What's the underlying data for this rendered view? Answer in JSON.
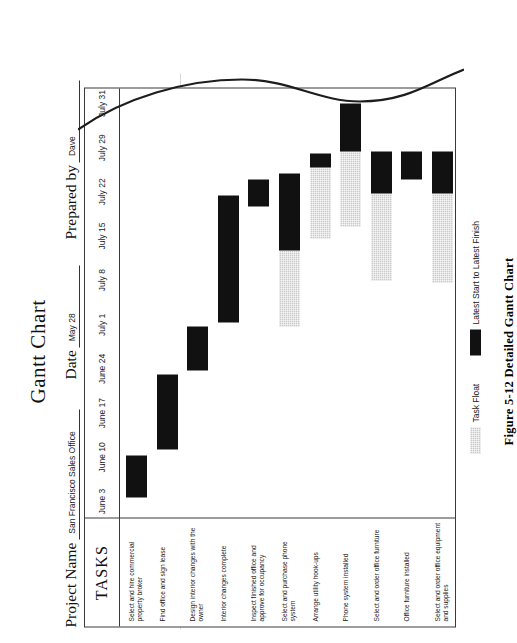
{
  "document": {
    "title": "Gantt Chart",
    "caption": "Figure 5-12  Detailed Gantt Chart"
  },
  "header": {
    "project_name_label": "Project Name",
    "project_name_value": "San Francisco Sales Office",
    "date_label": "Date",
    "date_value": "May 28",
    "prepared_by_label": "Prepared by",
    "prepared_by_value": "Dave"
  },
  "table": {
    "tasks_column_header": "TASKS"
  },
  "legend": {
    "float_label": "Task Float",
    "work_label": "Latest Start to Latest Finish",
    "float_color": "#c9c9c9",
    "work_color": "#111111"
  },
  "chart_data": {
    "type": "bar",
    "orientation": "horizontal",
    "title": "Gantt Chart",
    "subtitle": "San Francisco Sales Office",
    "xlabel": "",
    "ylabel": "TASKS",
    "grid": false,
    "legend_position": "bottom",
    "axis_ticks": [
      "June 3",
      "June 10",
      "June 17",
      "June 24",
      "July 1",
      "July 8",
      "July 15",
      "July 22",
      "July 29",
      "July 31"
    ],
    "axis_tick_positions_pct": [
      0,
      11.1,
      22.2,
      33.3,
      44.4,
      55.6,
      66.7,
      77.8,
      88.9,
      100
    ],
    "categories": [
      "Select and hire commercial property broker",
      "Find office and sign lease",
      "Design interior changes with the owner",
      "Interior changes complete",
      "Inspect finished office and approve for occupancy",
      "Select and purchase phone system",
      "Arrange utility hook-ups",
      "Phone system installed",
      "Select and order office furniture",
      "Office furniture installed",
      "Select and order office equipment and supplies"
    ],
    "series": [
      {
        "name": "Latest Start to Latest Finish",
        "color": "#111111"
      },
      {
        "name": "Task Float",
        "color": "#c9c9c9"
      }
    ],
    "bars": [
      {
        "task": "Select and hire commercial property broker",
        "work_start_pct": 1.0,
        "work_end_pct": 11.5,
        "float_start_pct": null,
        "float_end_pct": null
      },
      {
        "task": "Find office and sign lease",
        "work_start_pct": 13.0,
        "work_end_pct": 32.0,
        "float_start_pct": null,
        "float_end_pct": null
      },
      {
        "task": "Design interior changes with the owner",
        "work_start_pct": 33.0,
        "work_end_pct": 44.0,
        "float_start_pct": null,
        "float_end_pct": null
      },
      {
        "task": "Interior changes complete",
        "work_start_pct": 45.0,
        "work_end_pct": 77.0,
        "float_start_pct": null,
        "float_end_pct": null
      },
      {
        "task": "Inspect finished office and approve for occupancy",
        "work_start_pct": 74.0,
        "work_end_pct": 81.0,
        "float_start_pct": null,
        "float_end_pct": null
      },
      {
        "task": "Select and purchase phone system",
        "work_start_pct": 63.0,
        "work_end_pct": 82.5,
        "float_start_pct": 44.0,
        "float_end_pct": 63.0
      },
      {
        "task": "Arrange utility hook-ups",
        "work_start_pct": 84.0,
        "work_end_pct": 87.5,
        "float_start_pct": 66.0,
        "float_end_pct": 84.0
      },
      {
        "task": "Phone system installed",
        "work_start_pct": 88.0,
        "work_end_pct": 100.0,
        "float_start_pct": 69.0,
        "float_end_pct": 88.0
      },
      {
        "task": "Select and order office furniture",
        "work_start_pct": 77.5,
        "work_end_pct": 88.0,
        "float_start_pct": 55.5,
        "float_end_pct": 77.5
      },
      {
        "task": "Office furniture installed",
        "work_start_pct": 81.0,
        "work_end_pct": 88.0,
        "float_start_pct": null,
        "float_end_pct": null
      },
      {
        "task": "Select and order office equipment and supplies",
        "work_start_pct": 77.5,
        "work_end_pct": 88.0,
        "float_start_pct": 55.0,
        "float_end_pct": 77.5
      }
    ]
  }
}
